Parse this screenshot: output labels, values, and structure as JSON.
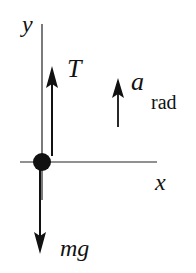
{
  "diagram": {
    "type": "free-body-diagram",
    "colors": {
      "ink": "#111111",
      "background": "#ffffff"
    },
    "axes": {
      "x_label": "x",
      "y_label": "y"
    },
    "forces": [
      {
        "name": "tension",
        "label": "T",
        "direction": "up"
      },
      {
        "name": "weight",
        "label": "mg",
        "direction": "down"
      }
    ],
    "acceleration": {
      "symbol": "a",
      "subscript": "rad",
      "direction": "up"
    },
    "body": {
      "shape": "dot"
    }
  }
}
